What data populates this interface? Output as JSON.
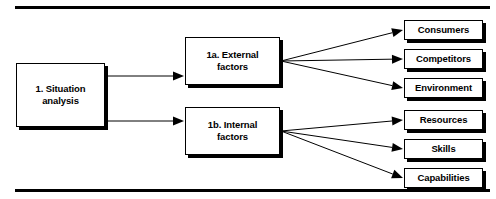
{
  "figure": {
    "rules": [
      {
        "name": "top-rule",
        "x": 15,
        "y": 6,
        "width": 475,
        "height": 3
      },
      {
        "name": "bottom-rule",
        "x": 15,
        "y": 189,
        "width": 475,
        "height": 3
      }
    ]
  },
  "nodes": {
    "root": {
      "id": "situation-analysis",
      "label": "1. Situation\nanalysis",
      "x": 16,
      "y": 63,
      "width": 89,
      "height": 64
    },
    "mid": [
      {
        "id": "external-factors",
        "label": "1a. External\nfactors",
        "x": 185,
        "y": 37,
        "width": 95,
        "height": 48
      },
      {
        "id": "internal-factors",
        "label": "1b. Internal\nfactors",
        "x": 185,
        "y": 107,
        "width": 95,
        "height": 48
      }
    ],
    "leaves": [
      {
        "id": "consumers",
        "label": "Consumers",
        "x": 404,
        "y": 20,
        "width": 79,
        "height": 20,
        "parent": "external-factors"
      },
      {
        "id": "competitors",
        "label": "Competitors",
        "x": 404,
        "y": 49,
        "width": 79,
        "height": 20,
        "parent": "external-factors"
      },
      {
        "id": "environment",
        "label": "Environment",
        "x": 404,
        "y": 78,
        "width": 79,
        "height": 20,
        "parent": "external-factors"
      },
      {
        "id": "resources",
        "label": "Resources",
        "x": 404,
        "y": 110,
        "width": 79,
        "height": 20,
        "parent": "internal-factors"
      },
      {
        "id": "skills",
        "label": "Skills",
        "x": 404,
        "y": 139,
        "width": 79,
        "height": 20,
        "parent": "internal-factors"
      },
      {
        "id": "capabilities",
        "label": "Capabilities",
        "x": 404,
        "y": 168,
        "width": 79,
        "height": 20,
        "parent": "internal-factors"
      }
    ]
  },
  "edges": [
    {
      "name": "edge-situation-to-external",
      "x1": 106,
      "y1": 76,
      "x2": 184,
      "y2": 76
    },
    {
      "name": "edge-situation-to-internal",
      "x1": 106,
      "y1": 121,
      "x2": 184,
      "y2": 121
    },
    {
      "name": "edge-external-to-consumers",
      "x1": 281,
      "y1": 61,
      "x2": 403,
      "y2": 30
    },
    {
      "name": "edge-external-to-competitors",
      "x1": 281,
      "y1": 61,
      "x2": 403,
      "y2": 59
    },
    {
      "name": "edge-external-to-environment",
      "x1": 281,
      "y1": 61,
      "x2": 403,
      "y2": 88
    },
    {
      "name": "edge-internal-to-resources",
      "x1": 281,
      "y1": 131,
      "x2": 403,
      "y2": 120
    },
    {
      "name": "edge-internal-to-skills",
      "x1": 281,
      "y1": 131,
      "x2": 403,
      "y2": 149
    },
    {
      "name": "edge-internal-to-capabilities",
      "x1": 281,
      "y1": 131,
      "x2": 403,
      "y2": 178
    }
  ],
  "colors": {
    "stroke": "#000000",
    "fill": "#ffffff",
    "shadow": "#000000"
  }
}
